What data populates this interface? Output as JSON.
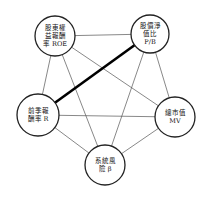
{
  "diagram": {
    "type": "complete-graph",
    "nodes": [
      {
        "id": "roe",
        "lines": [
          "股東權",
          "益報酬",
          "率 ROE"
        ],
        "cx": 55,
        "cy": 36,
        "r": 20
      },
      {
        "id": "pb",
        "lines": [
          "股價淨",
          "值比",
          "P/B"
        ],
        "cx": 150,
        "cy": 34,
        "r": 19
      },
      {
        "id": "r",
        "lines": [
          "前季報",
          "酬率 R"
        ],
        "cx": 38,
        "cy": 115,
        "r": 21
      },
      {
        "id": "mv",
        "lines": [
          "總市值",
          "MV"
        ],
        "cx": 175,
        "cy": 117,
        "r": 20
      },
      {
        "id": "beta",
        "lines": [
          "系統風",
          "險 β"
        ],
        "cx": 105,
        "cy": 165,
        "r": 20
      }
    ],
    "edges": [
      {
        "from": "roe",
        "to": "pb",
        "weight": "thin"
      },
      {
        "from": "roe",
        "to": "r",
        "weight": "thin"
      },
      {
        "from": "roe",
        "to": "mv",
        "weight": "thin"
      },
      {
        "from": "roe",
        "to": "beta",
        "weight": "thin"
      },
      {
        "from": "pb",
        "to": "r",
        "weight": "thick"
      },
      {
        "from": "pb",
        "to": "mv",
        "weight": "thin"
      },
      {
        "from": "pb",
        "to": "beta",
        "weight": "thin"
      },
      {
        "from": "r",
        "to": "mv",
        "weight": "thin"
      },
      {
        "from": "r",
        "to": "beta",
        "weight": "thin"
      },
      {
        "from": "mv",
        "to": "beta",
        "weight": "thin"
      }
    ],
    "colors": {
      "stroke": "#222222",
      "fill": "#ffffff",
      "text": "#111111"
    }
  }
}
